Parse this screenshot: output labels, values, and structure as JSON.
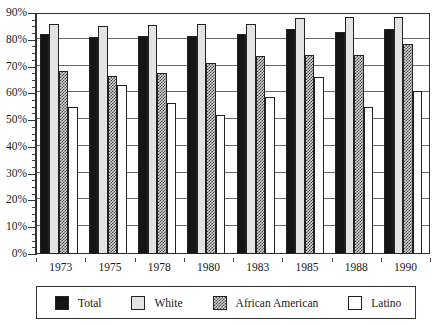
{
  "chart_data": {
    "type": "bar",
    "title": "",
    "xlabel": "",
    "ylabel": "",
    "ylim": [
      0,
      90
    ],
    "y_tick_step": 10,
    "y_minor_tick_step": 2.5,
    "grid": true,
    "legend_position": "bottom",
    "categories": [
      "1973",
      "1975",
      "1978",
      "1980",
      "1983",
      "1985",
      "1988",
      "1990"
    ],
    "y_tick_labels": [
      "0%",
      "10%",
      "20%",
      "30%",
      "40%",
      "50%",
      "60%",
      "70%",
      "80%",
      "90%"
    ],
    "series": [
      {
        "name": "Total",
        "color": "#151515",
        "pattern": "solid-black",
        "values": [
          82,
          81,
          81.5,
          81.5,
          82,
          84,
          83,
          84
        ]
      },
      {
        "name": "White",
        "color": "#e3e3e3",
        "pattern": "solid-light-gray",
        "values": [
          86,
          85,
          85.5,
          86,
          86,
          88,
          88.5,
          88.5
        ]
      },
      {
        "name": "African American",
        "color": "#d2d2d2",
        "pattern": "checkered",
        "values": [
          68.5,
          66.5,
          67.5,
          71.5,
          74,
          74.5,
          74.5,
          78.5
        ]
      },
      {
        "name": "Latino",
        "color": "#ffffff",
        "pattern": "solid-white",
        "values": [
          55,
          63,
          56.5,
          52,
          58.5,
          66,
          55,
          61
        ]
      }
    ]
  },
  "title_sliver": {
    "text": "y"
  },
  "legend": {
    "entries": [
      {
        "label": "Total"
      },
      {
        "label": "White"
      },
      {
        "label": "African American"
      },
      {
        "label": "Latino"
      }
    ]
  }
}
